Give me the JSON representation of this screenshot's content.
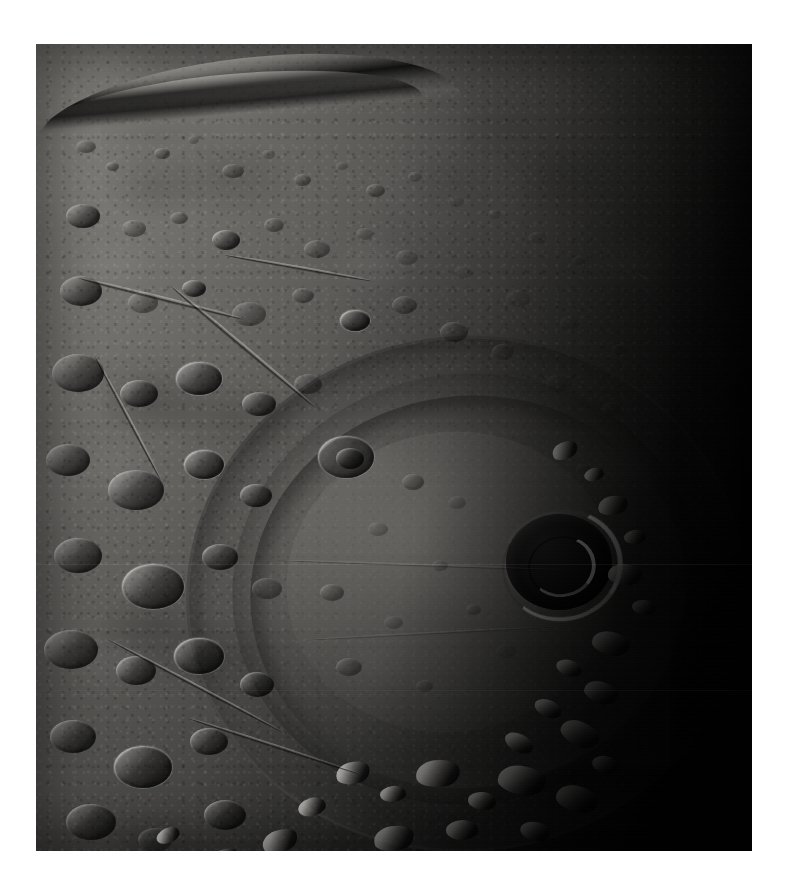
{
  "page": {
    "background_color": "#ffffff",
    "width": 798,
    "height": 896
  },
  "photo": {
    "name": "planetary-surface-photograph",
    "alt_text": "Grayscale spacecraft photograph of a heavily cratered planetary surface showing a large multi-ring impact basin, with the curved limb of the world crossing the upper left and the terminator fading into black space on the right.",
    "frame": {
      "x": 36,
      "y": 44,
      "width": 716,
      "height": 807
    },
    "palette": {
      "space_black": "#000000",
      "shadow": "#0a0a0a",
      "terrain_dark": "#2e2e2d",
      "terrain_mid": "#6a6a66",
      "terrain_light": "#a8a6a0",
      "highlight": "#e9e7e2",
      "specular": "#ffffff"
    },
    "scene": {
      "subject": "cratered planetary body",
      "illumination": "sunlight from upper left, terminator toward lower right",
      "limb_position": "upper left arc",
      "night_side": "right third of frame"
    },
    "features": [
      {
        "name": "limb-ridge-scarp",
        "label": "Terraced ridge along the upper-left limb"
      },
      {
        "name": "northern-cratered-highlands",
        "label": "Densely cratered northern highlands"
      },
      {
        "name": "multi-ring-impact-basin",
        "label": "Large multi-ring impact basin"
      },
      {
        "name": "basin-smooth-plains",
        "label": "Smooth interior plains of the basin"
      },
      {
        "name": "basin-rim-massifs",
        "label": "Bright rim massifs on the sunlit basin wall"
      },
      {
        "name": "terminator-crater",
        "label": "Prominent rimmed crater near the terminator"
      },
      {
        "name": "southern-mountain-belt",
        "label": "Rugged mountain belt across the lower frame"
      },
      {
        "name": "night-side",
        "label": "Unilluminated night side"
      }
    ]
  }
}
